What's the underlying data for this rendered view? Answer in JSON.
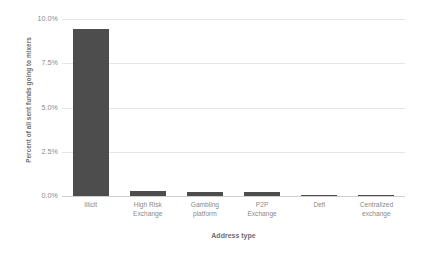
{
  "chart_data": {
    "type": "bar",
    "title": "",
    "xlabel": "Address type",
    "ylabel": "Percent of all sent funds going to mixers",
    "categories": [
      "Illicit",
      "High Risk\nExchange",
      "Gambling\nplatform",
      "P2P\nExchange",
      "Defi",
      "Centralized\nexchange"
    ],
    "values": [
      9.45,
      0.28,
      0.23,
      0.22,
      0.06,
      0.02
    ],
    "ylim": [
      0,
      10
    ],
    "ytick_values": [
      0,
      2.5,
      5,
      7.5,
      10
    ],
    "ytick_labels": [
      "0.0%",
      "2.5%",
      "5.0%",
      "7.5%",
      "10.0%"
    ],
    "grid": true,
    "legend": "none",
    "bar_color": "#4d4d4d",
    "gridline_color": "#e6e6e6",
    "axis_color": "#cfcfcf",
    "text_color": "#8a8a8a",
    "background_color": "#ffffff"
  }
}
